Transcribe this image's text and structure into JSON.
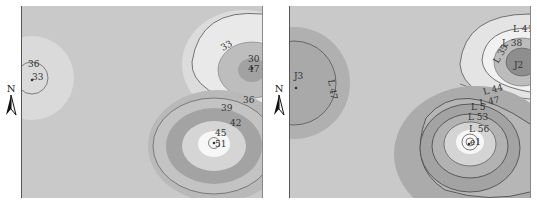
{
  "figure": {
    "panels": [
      {
        "id": "left",
        "north_label": "N",
        "contour_labels": [
          "36",
          "33",
          "33",
          "30",
          "47",
          "36",
          "39",
          "42",
          "45",
          "51"
        ]
      },
      {
        "id": "right",
        "north_label": "N",
        "contour_labels": [
          "J3",
          "L 47",
          "L 41",
          "L 38",
          "L 35",
          "J2",
          "L 44",
          "L 47",
          "L 5",
          "L 53",
          "L 56",
          "e1"
        ]
      }
    ]
  },
  "colors": {
    "background": "#c9c9c9",
    "light": "#dedede",
    "lighter": "#ebebeb",
    "white": "#f7f7f7",
    "mid": "#b3b3b3",
    "dark": "#9c9c9c",
    "darker": "#8a8a8a",
    "line": "#555555"
  }
}
